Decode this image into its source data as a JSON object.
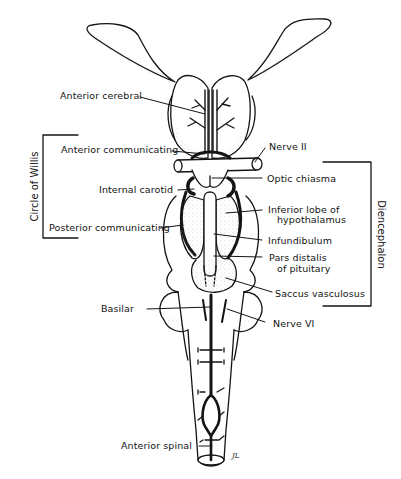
{
  "figure": {
    "colors": {
      "ink": "#141414",
      "background": "#ffffff",
      "stipple": "#9a9a9a"
    }
  },
  "labels": {
    "anterior_cerebral": "Anterior cerebral",
    "anterior_communicating": "Anterior communicating",
    "nerve_ii": "Nerve II",
    "optic_chiasma": "Optic chiasma",
    "internal_carotid": "Internal carotid",
    "inferior_lobe_line1": "Inferior lobe of",
    "inferior_lobe_line2": "hypothalamus",
    "posterior_communicating": "Posterior communicating",
    "infundibulum": "Infundibulum",
    "pars_distalis_line1": "Pars distalis",
    "pars_distalis_line2": "of pituitary",
    "saccus_vasculosus": "Saccus vasculosus",
    "basilar": "Basilar",
    "nerve_vi": "Nerve VI",
    "anterior_spinal": "Anterior spinal",
    "signature": "JL"
  },
  "brackets": {
    "left": "Circle of Willis",
    "right": "Diencephalon"
  }
}
